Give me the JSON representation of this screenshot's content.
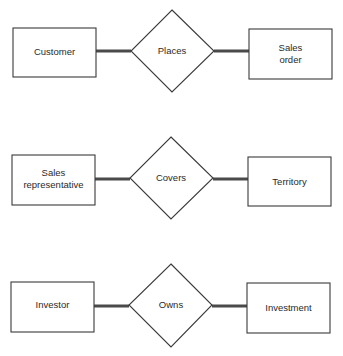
{
  "diagram": {
    "type": "entity-relationship",
    "colors": {
      "stroke": "#3a3a3a",
      "connector": "#4a4a4a",
      "text": "#2a2a2a",
      "background": "#ffffff"
    },
    "rows": [
      {
        "left_entity": {
          "lines": [
            "Customer"
          ]
        },
        "relationship": {
          "label": "Places"
        },
        "right_entity": {
          "lines": [
            "Sales",
            "order"
          ]
        }
      },
      {
        "left_entity": {
          "lines": [
            "Sales",
            "representative"
          ]
        },
        "relationship": {
          "label": "Covers"
        },
        "right_entity": {
          "lines": [
            "Territory"
          ]
        }
      },
      {
        "left_entity": {
          "lines": [
            "Investor"
          ]
        },
        "relationship": {
          "label": "Owns"
        },
        "right_entity": {
          "lines": [
            "Investment"
          ]
        }
      }
    ]
  }
}
